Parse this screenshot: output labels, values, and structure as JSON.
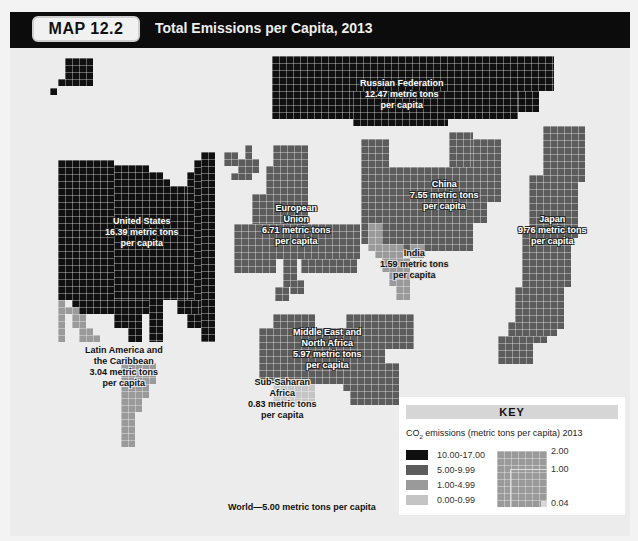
{
  "header": {
    "badge": "MAP 12.2",
    "title": "Total Emissions per Capita, 2013"
  },
  "colors": {
    "range_10_17": "#101010",
    "range_5_10": "#5c5c5c",
    "range_1_5": "#9a9a9a",
    "range_0_1": "#c4c4c4"
  },
  "regions": [
    {
      "id": "russian-federation",
      "name": "Russian Federation",
      "value": "12.47 metric tons",
      "unit": "per capita",
      "class": "range_10_17"
    },
    {
      "id": "united-states",
      "name": "United States",
      "value": "16.39 metric tons",
      "unit": "per capita",
      "class": "range_10_17"
    },
    {
      "id": "european-union",
      "name": "European Union",
      "value": "6.71 metric tons",
      "unit": "per capita",
      "class": "range_5_10"
    },
    {
      "id": "china",
      "name": "China",
      "value": "7.55 metric tons",
      "unit": "per capita",
      "class": "range_5_10"
    },
    {
      "id": "japan",
      "name": "Japan",
      "value": "9.76 metric tons",
      "unit": "per capita",
      "class": "range_5_10"
    },
    {
      "id": "india",
      "name": "India",
      "value": "1.59 metric tons",
      "unit": "per capita",
      "class": "range_1_5"
    },
    {
      "id": "middle-east-north-africa",
      "name": "Middle East and North Africa",
      "value": "5.97 metric tons",
      "unit": "per capita",
      "class": "range_5_10"
    },
    {
      "id": "latin-america-caribbean",
      "name": "Latin America and the Caribbean",
      "value": "3.04 metric tons",
      "unit": "per capita",
      "class": "range_1_5"
    },
    {
      "id": "sub-saharan-africa",
      "name": "Sub-Saharan Africa",
      "value": "0.83 metric tons",
      "unit": "per capita",
      "class": "range_0_1"
    }
  ],
  "labels": {
    "russia": [
      "Russian Federation",
      "12.47 metric tons",
      "per capita"
    ],
    "us": [
      "United States",
      "16.39 metric tons",
      "per capita"
    ],
    "eu": [
      "European",
      "Union",
      "6.71 metric tons",
      "per capita"
    ],
    "china": [
      "China",
      "7.55 metric tons",
      "per capita"
    ],
    "japan": [
      "Japan",
      "9.76 metric tons",
      "per capita"
    ],
    "india": [
      "India",
      "1.59 metric tons",
      "per capita"
    ],
    "mena": [
      "Middle East and",
      "North Africa",
      "5.97 metric tons",
      "per capita"
    ],
    "latam": [
      "Latin America and",
      "the Caribbean",
      "3.04 metric tons",
      "per capita"
    ],
    "ssa": [
      "Sub-Saharan",
      "Africa",
      "0.83 metric tons",
      "per capita"
    ]
  },
  "world_note": "World—5.00 metric tons per capita",
  "key": {
    "title": "KEY",
    "subtitle_pre": "CO",
    "subtitle_sub": "2",
    "subtitle_post": " emissions (metric tons per capita) 2013",
    "legend": [
      {
        "label": "10.00-17.00",
        "color": "#101010"
      },
      {
        "label": "5.00-9.99",
        "color": "#5c5c5c"
      },
      {
        "label": "1.00-4.99",
        "color": "#9a9a9a"
      },
      {
        "label": "0.00-0.99",
        "color": "#c4c4c4"
      }
    ],
    "scale": [
      "2.00",
      "1.00",
      "0.04"
    ]
  }
}
